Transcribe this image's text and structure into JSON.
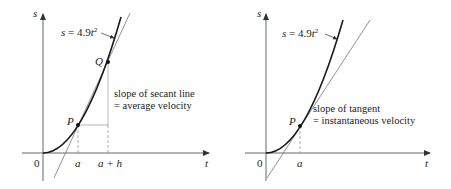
{
  "figure": {
    "left_panel": {
      "axis_x_label": "t",
      "axis_y_label": "s",
      "origin_label": "0",
      "curve_label": "s = 4.9t²",
      "curve_label_parts": {
        "lhs": "s",
        "eq": " = 4.9",
        "var": "t",
        "exp": "2"
      },
      "point_p_label": "P",
      "point_q_label": "Q",
      "tick_a_label": "a",
      "tick_a_plus_h_label": "a + h",
      "annotation_line1": "slope of secant line",
      "annotation_line2": "= average velocity"
    },
    "right_panel": {
      "axis_x_label": "t",
      "axis_y_label": "s",
      "origin_label": "0",
      "curve_label": "s = 4.9t²",
      "curve_label_parts": {
        "lhs": "s",
        "eq": " = 4.9",
        "var": "t",
        "exp": "2"
      },
      "point_p_label": "P",
      "tick_a_label": "a",
      "annotation_line1": "slope of tangent",
      "annotation_line2": "= instantaneous velocity"
    },
    "colors": {
      "curve": "#1a1a1a",
      "axis": "#555555",
      "line": "#777777",
      "text": "#222222"
    }
  }
}
